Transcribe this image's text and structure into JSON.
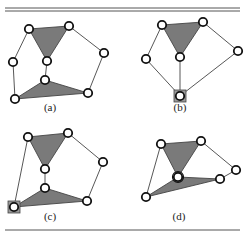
{
  "figure": {
    "panels": [
      {
        "id": "a",
        "label": "(a)",
        "label_pos": [
          50,
          111
        ],
        "nodes": [
          [
            29,
            29
          ],
          [
            69,
            26
          ],
          [
            104,
            53
          ],
          [
            13,
            62
          ],
          [
            47,
            61
          ],
          [
            45,
            80
          ],
          [
            15,
            99
          ],
          [
            88,
            93
          ]
        ],
        "faces": [
          [
            [
              29,
              29
            ],
            [
              69,
              26
            ],
            [
              47,
              61
            ]
          ],
          [
            [
              45,
              80
            ],
            [
              15,
              99
            ],
            [
              88,
              93
            ]
          ]
        ],
        "edges": [
          [
            [
              29,
              29
            ],
            [
              13,
              62
            ]
          ],
          [
            [
              13,
              62
            ],
            [
              15,
              99
            ]
          ],
          [
            [
              69,
              26
            ],
            [
              104,
              53
            ]
          ],
          [
            [
              104,
              53
            ],
            [
              88,
              93
            ]
          ],
          [
            [
              47,
              61
            ],
            [
              45,
              80
            ]
          ]
        ],
        "squares": []
      },
      {
        "id": "b",
        "label": "(b)",
        "label_pos": [
          180,
          111
        ],
        "nodes": [
          [
            162,
            25
          ],
          [
            203,
            22
          ],
          [
            238,
            51
          ],
          [
            146,
            59
          ],
          [
            180,
            57
          ],
          [
            180,
            96
          ]
        ],
        "faces": [
          [
            [
              162,
              25
            ],
            [
              203,
              22
            ],
            [
              180,
              57
            ]
          ]
        ],
        "edges": [
          [
            [
              162,
              25
            ],
            [
              146,
              59
            ]
          ],
          [
            [
              146,
              59
            ],
            [
              180,
              96
            ]
          ],
          [
            [
              203,
              22
            ],
            [
              238,
              51
            ]
          ],
          [
            [
              238,
              51
            ],
            [
              180,
              96
            ]
          ],
          [
            [
              180,
              57
            ],
            [
              180,
              96
            ]
          ]
        ],
        "squares": [
          [
            180,
            96
          ]
        ]
      },
      {
        "id": "c",
        "label": "(c)",
        "label_pos": [
          50,
          220
        ],
        "nodes": [
          [
            28,
            137
          ],
          [
            68,
            133
          ],
          [
            103,
            162
          ],
          [
            45,
            169
          ],
          [
            45,
            188
          ],
          [
            14,
            207
          ],
          [
            87,
            201
          ]
        ],
        "faces": [
          [
            [
              28,
              137
            ],
            [
              68,
              133
            ],
            [
              45,
              169
            ]
          ],
          [
            [
              45,
              188
            ],
            [
              14,
              207
            ],
            [
              87,
              201
            ]
          ]
        ],
        "edges": [
          [
            [
              28,
              137
            ],
            [
              14,
              207
            ]
          ],
          [
            [
              68,
              133
            ],
            [
              103,
              162
            ]
          ],
          [
            [
              103,
              162
            ],
            [
              87,
              201
            ]
          ],
          [
            [
              45,
              169
            ],
            [
              45,
              188
            ]
          ]
        ],
        "squares": [
          [
            14,
            207
          ]
        ]
      },
      {
        "id": "d",
        "label": "(d)",
        "label_pos": [
          179,
          220
        ],
        "nodes": [
          [
            161,
            144
          ],
          [
            201,
            141
          ],
          [
            236,
            170
          ],
          [
            178,
            177
          ],
          [
            220,
            179
          ],
          [
            146,
            197
          ]
        ],
        "faces": [
          [
            [
              161,
              144
            ],
            [
              201,
              141
            ],
            [
              178,
              177
            ]
          ],
          [
            [
              178,
              177
            ],
            [
              146,
              197
            ],
            [
              220,
              179
            ]
          ]
        ],
        "edges": [
          [
            [
              161,
              144
            ],
            [
              146,
              197
            ]
          ],
          [
            [
              201,
              141
            ],
            [
              236,
              170
            ]
          ],
          [
            [
              236,
              170
            ],
            [
              220,
              179
            ]
          ]
        ],
        "squares": [],
        "double_nodes": [
          [
            178,
            177
          ]
        ]
      }
    ],
    "rules": {
      "top_double": [
        [
          5,
          240,
          8
        ],
        [
          5,
          240,
          11
        ]
      ],
      "bottom_single": [
        [
          5,
          240,
          230
        ]
      ]
    },
    "colors": {
      "face_fill": "#7a7a7a",
      "node_stroke": "#111111",
      "edge": "#444444"
    }
  }
}
